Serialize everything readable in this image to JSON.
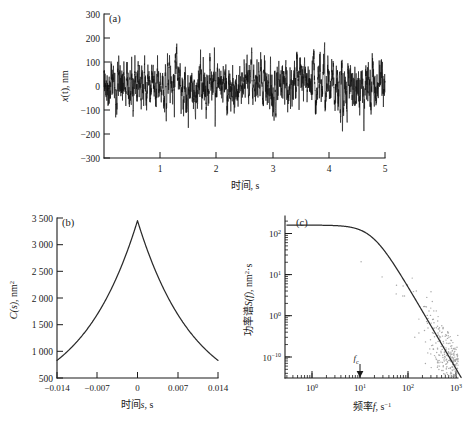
{
  "figure": {
    "background": "#ffffff",
    "ink": "#1a1a1a",
    "scatter_color": "#a8a8a8"
  },
  "chart_data": [
    {
      "type": "line",
      "panel": "a",
      "panel_label": "(a)",
      "title": "",
      "xlabel": "时间, s",
      "ylabel_parts": {
        "var": "x",
        "arg": "(t)",
        "unit": ", nm"
      },
      "ylabel": "x(t), nm",
      "xlim": [
        0,
        5
      ],
      "ylim": [
        -300,
        300
      ],
      "xticks": [
        1,
        2,
        3,
        4,
        5
      ],
      "xtick_labels": [
        "1",
        "2",
        "3",
        "4",
        "5"
      ],
      "yticks": [
        -300,
        -200,
        -100,
        0,
        100,
        200,
        300
      ],
      "ytick_labels": [
        "−300",
        "−200",
        "−100",
        "0",
        "100",
        "200",
        "300"
      ],
      "grid": false,
      "series_description": "Brownian position fluctuation time trace, dense black noise, amplitude roughly ±150 nm",
      "noise_std_nm": 58,
      "n_points": 2600,
      "seed": 20240517
    },
    {
      "type": "line",
      "panel": "b",
      "panel_label": "(b)",
      "title": "",
      "xlabel_parts": {
        "cn": "时间",
        "var": "s",
        "unit": ", s"
      },
      "xlabel": "时间s, s",
      "ylabel_parts": {
        "var": "C",
        "arg": "(s)",
        "unit": ", nm",
        "sup": "2"
      },
      "ylabel": "C(s), nm²",
      "xlim": [
        -0.014,
        0.014
      ],
      "ylim": [
        500,
        3500
      ],
      "xticks": [
        -0.014,
        -0.007,
        0,
        0.007,
        0.014
      ],
      "xtick_labels": [
        "−0.014",
        "−0.007",
        "0",
        "0.007",
        "0.014"
      ],
      "yticks": [
        500,
        1000,
        1500,
        2000,
        2500,
        3000,
        3500
      ],
      "ytick_labels": [
        "500",
        "1 000",
        "1 500",
        "2 000",
        "2 500",
        "3 000",
        "3 500"
      ],
      "grid": false,
      "series_description": "Autocorrelation function, two-sided exponential decay peaking at s = 0",
      "peak_value": 3450,
      "decay_tau": 0.0048,
      "edge_value": 830
    },
    {
      "type": "scatter",
      "panel": "c",
      "panel_label": "(c)",
      "title": "",
      "xlabel_parts": {
        "cn": "频率",
        "var": "f",
        "unit": ", s",
        "sup": "−1"
      },
      "xlabel": "频率f, s⁻¹",
      "ylabel_parts": {
        "cn": "功率谱",
        "var": "S",
        "arg": "(f)",
        "unit": ", nm",
        "sup": "2",
        "unit2": "·s"
      },
      "ylabel": "功率谱S(f), nm²·s",
      "xscale": "log",
      "yscale": "log",
      "xlim": [
        0.3,
        3000
      ],
      "ylim": [
        1e-11,
        1000
      ],
      "xticks": [
        1,
        10,
        100,
        1000
      ],
      "xtick_labels": [
        "10⁰",
        "10¹",
        "10²",
        "10³"
      ],
      "xtick_exponents": [
        "0",
        "1",
        "2",
        "3"
      ],
      "yticks": [
        100,
        10,
        1,
        1e-10
      ],
      "ytick_labels": [
        "10²",
        "10¹",
        "10⁰",
        "10⁻¹⁰"
      ],
      "ytick_exponents": [
        "2",
        "1",
        "0",
        "−10"
      ],
      "grid": false,
      "fit_description": "Lorentzian power spectrum fit, plateau then roll-off above corner frequency",
      "plateau_value": 160,
      "corner_frequency": 18,
      "annotation": {
        "label": "f",
        "subscript": "c",
        "at_x": 18,
        "marker": "down-arrow"
      },
      "scatter_description": "Gray periodogram points scattering about the Lorentzian fit",
      "n_points": 2400,
      "seed": 8831
    }
  ]
}
